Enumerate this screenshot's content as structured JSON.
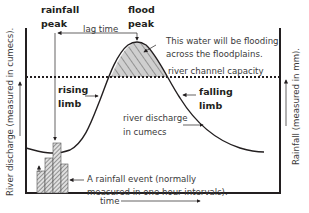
{
  "diagram": {
    "labels": {
      "rainfall_peak_line1": "rainfall",
      "rainfall_peak_line2": "peak",
      "flood_peak_line1": "flood",
      "flood_peak_line2": "peak",
      "lag_time": "lag time",
      "flood_water_line1": "This water will be flooding",
      "flood_water_line2": "across the floodplains.",
      "channel_capacity": "river channel capacity",
      "rising_limb_line1": "rising",
      "rising_limb_line2": "limb",
      "falling_limb_line1": "falling",
      "falling_limb_line2": "limb",
      "discharge_line1": "river discharge",
      "discharge_line2": "in cumecs",
      "rainfall_event_line1": "A rainfall event (normally",
      "rainfall_event_line2": "measured in one hour intervals).",
      "x_axis": "time",
      "y_axis_left": "River discharge (measured in cumecs).",
      "y_axis_right": "Rainfall (measured in mm)."
    },
    "colors": {
      "line": "#231f20",
      "text": "#3a3a3a",
      "hatch_fill": "#bdbdbd",
      "background": "#ffffff"
    },
    "rainfall_bars": [
      {
        "hour": 1,
        "relative_height": 0.45
      },
      {
        "hour": 2,
        "relative_height": 0.75
      },
      {
        "hour": 3,
        "relative_height": 1.0
      },
      {
        "hour": 4,
        "relative_height": 0.55
      }
    ]
  }
}
